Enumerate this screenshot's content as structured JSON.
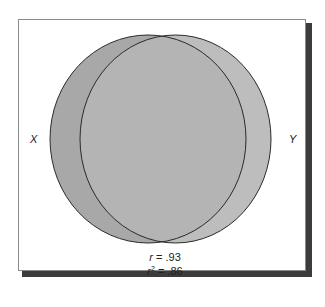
{
  "diagram": {
    "type": "venn",
    "sets": [
      {
        "id": "X",
        "label": "X",
        "fill": "#a8a8a8"
      },
      {
        "id": "Y",
        "label": "Y",
        "fill": "#bdbdbd"
      }
    ],
    "overlap_fill": "#b4b4b4",
    "stroke": "#2a2a2a",
    "frame": {
      "border": "#8a8a8a",
      "shadow": "#3c3c3c"
    },
    "stats": {
      "r_symbol": "r",
      "r_value": " = .93",
      "r2_symbol": "r",
      "r2_exponent": "2",
      "r2_value": " = .86"
    }
  }
}
